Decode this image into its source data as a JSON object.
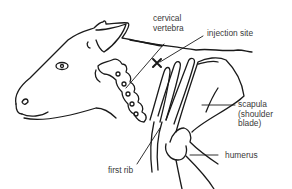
{
  "diagram": {
    "labels": {
      "cervical_vertebra_line1": "cervical",
      "cervical_vertebra_line2": "vertebra",
      "injection_site": "injection site",
      "injection_marker": "×",
      "scapula_line1": "scapula",
      "scapula_line2": "(shoulder",
      "scapula_line3": "blade)",
      "humerus": "humerus",
      "first_rib": "first rib"
    },
    "colors": {
      "line": "#1a1a1a",
      "text": "#3a3a3a",
      "background": "#ffffff"
    }
  }
}
